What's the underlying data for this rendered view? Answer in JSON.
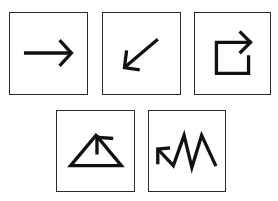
{
  "figure": {
    "colors": {
      "background": "#ffffff",
      "frame": "#2a2a2a",
      "stroke": "#111111"
    },
    "rows": [
      {
        "tiles": [
          {
            "index": 1,
            "icon": "arrow-right-icon"
          },
          {
            "index": 2,
            "icon": "arrow-down-left-icon"
          },
          {
            "index": 3,
            "icon": "square-with-right-arrow-icon"
          }
        ]
      },
      {
        "tiles": [
          {
            "index": 4,
            "icon": "triangle-with-up-left-arrow-icon"
          },
          {
            "index": 5,
            "icon": "zigzag-with-up-left-arrow-icon"
          }
        ]
      }
    ]
  }
}
